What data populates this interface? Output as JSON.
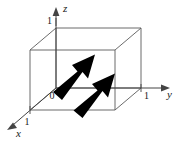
{
  "figure": {
    "background_color": "#ffffff",
    "line_color": "#555555",
    "axis_color": "#444444",
    "arrow_color": "#000000"
  },
  "axes": [
    {
      "name": "z",
      "label": "z",
      "direction": "up",
      "tick_label": "1"
    },
    {
      "name": "y",
      "label": "y",
      "direction": "right",
      "tick_label": "1"
    },
    {
      "name": "x",
      "label": "x",
      "direction": "down-left",
      "tick_label": "1"
    }
  ],
  "origin": {
    "label": "0"
  },
  "cube": {
    "name": "unit-cube",
    "edge_count": 12,
    "stroke": "#555555"
  },
  "vectors": [
    {
      "name": "vector-1",
      "label": "",
      "direction": "up-right",
      "fill": "#000000"
    },
    {
      "name": "vector-2",
      "label": "",
      "direction": "up-right",
      "fill": "#000000"
    }
  ]
}
